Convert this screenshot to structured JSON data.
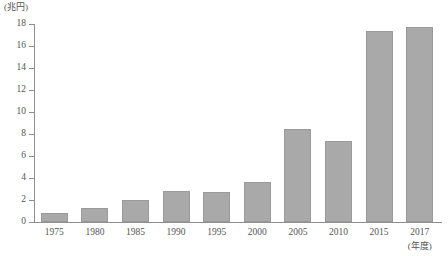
{
  "chart_data": {
    "type": "bar",
    "title": "",
    "subtitle": "",
    "xlabel": "(年度)",
    "ylabel": "(兆円)",
    "categories": [
      "1975",
      "1980",
      "1985",
      "1990",
      "1995",
      "2000",
      "2005",
      "2010",
      "2015",
      "2017"
    ],
    "values": [
      0.8,
      1.3,
      2.0,
      2.8,
      2.7,
      3.6,
      8.5,
      7.4,
      17.4,
      17.7
    ],
    "ylim": [
      0,
      18
    ],
    "ytick_values": [
      0,
      2,
      4,
      6,
      8,
      10,
      12,
      14,
      16,
      18
    ],
    "ytick_labels": [
      "0",
      "2",
      "4",
      "6",
      "8",
      "10",
      "12",
      "14",
      "16",
      "18"
    ],
    "grid": false,
    "legend": null,
    "series": [
      {
        "name": "",
        "values": [
          0.8,
          1.3,
          2.0,
          2.8,
          2.7,
          3.6,
          8.5,
          7.4,
          17.4,
          17.7
        ]
      }
    ],
    "colors": {
      "bar_fill": "#a9a9a9",
      "bar_border": "#9a9a9a",
      "axis": "#8e8e8e",
      "text": "#545454",
      "background": "#ffffff"
    }
  }
}
